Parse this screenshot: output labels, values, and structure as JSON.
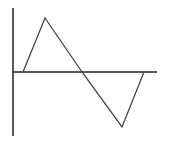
{
  "diagram": {
    "type": "triangle-wave-sketch",
    "colors": {
      "axis": "#222222",
      "wave": "#444444",
      "background": "#ffffff"
    },
    "axes": {
      "vertical": {
        "x": 13,
        "y1": 8,
        "y2": 136
      },
      "horizontal": {
        "y": 72,
        "x1": 13,
        "x2": 157
      }
    },
    "waveform": {
      "points": [
        [
          23,
          72
        ],
        [
          45,
          18
        ],
        [
          82,
          72
        ],
        [
          122,
          127
        ],
        [
          144,
          72
        ]
      ]
    }
  }
}
